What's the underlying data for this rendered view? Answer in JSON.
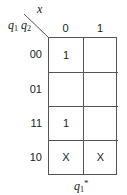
{
  "kmap": {
    "column_variable": "x",
    "row_variables": {
      "first": "q",
      "first_sub": "1",
      "second": "q",
      "second_sub": "2"
    },
    "column_headers": [
      "0",
      "1"
    ],
    "row_headers": [
      "00",
      "01",
      "11",
      "10"
    ],
    "cells": [
      [
        "1",
        ""
      ],
      [
        "",
        ""
      ],
      [
        "1",
        ""
      ],
      [
        "X",
        "X"
      ]
    ],
    "output_label": {
      "var": "q",
      "sub": "1",
      "sup": "*"
    }
  }
}
